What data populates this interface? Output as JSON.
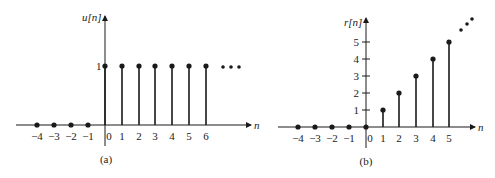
{
  "figure_a": {
    "caption": "(a)",
    "ylabel": "u[n]",
    "xlabel": "n",
    "ytick_label": "1",
    "xtick_labels": [
      "−4",
      "−3",
      "−2",
      "−1",
      "0",
      "1",
      "2",
      "3",
      "4",
      "5",
      "6"
    ],
    "ellipsis": "•••",
    "stems": [
      {
        "n": -4,
        "value": 0
      },
      {
        "n": -3,
        "value": 0
      },
      {
        "n": -2,
        "value": 0
      },
      {
        "n": -1,
        "value": 0
      },
      {
        "n": 0,
        "value": 1
      },
      {
        "n": 1,
        "value": 1
      },
      {
        "n": 2,
        "value": 1
      },
      {
        "n": 3,
        "value": 1
      },
      {
        "n": 4,
        "value": 1
      },
      {
        "n": 5,
        "value": 1
      },
      {
        "n": 6,
        "value": 1
      }
    ]
  },
  "figure_b": {
    "caption": "(b)",
    "ylabel": "r[n]",
    "xlabel": "n",
    "ytick_labels": [
      "1",
      "2",
      "3",
      "4",
      "5"
    ],
    "xtick_labels": [
      "−4",
      "−3",
      "−2",
      "−1",
      "0",
      "1",
      "2",
      "3",
      "4",
      "5"
    ],
    "stems": [
      {
        "n": -4,
        "value": 0
      },
      {
        "n": -3,
        "value": 0
      },
      {
        "n": -2,
        "value": 0
      },
      {
        "n": -1,
        "value": 0
      },
      {
        "n": 0,
        "value": 0
      },
      {
        "n": 1,
        "value": 1
      },
      {
        "n": 2,
        "value": 2
      },
      {
        "n": 3,
        "value": 3
      },
      {
        "n": 4,
        "value": 4
      },
      {
        "n": 5,
        "value": 5
      }
    ]
  },
  "colors": {
    "ink": "#1a1a1a",
    "background": "#ffffff"
  }
}
